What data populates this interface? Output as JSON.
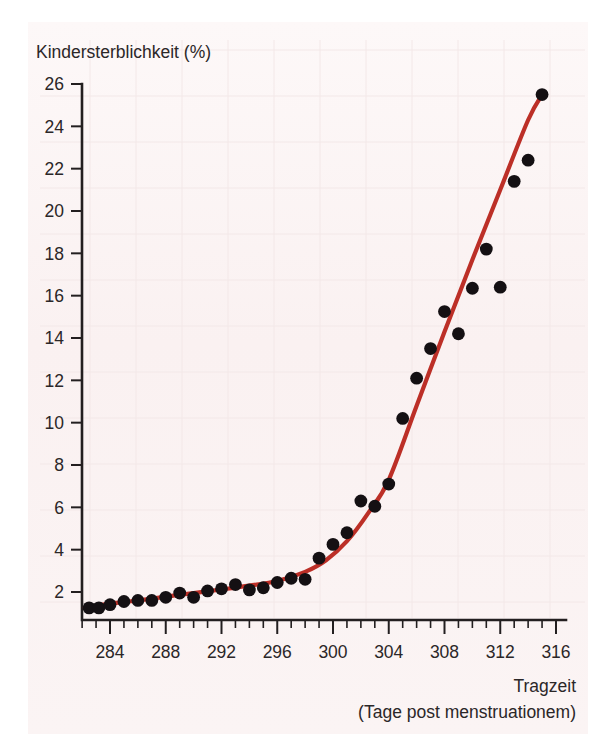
{
  "figure": {
    "background_color": "#fbf4f4",
    "page_color": "#ffffff",
    "line_color": "#bc2f27",
    "point_color": "#141013",
    "axis_color": "#231f20"
  },
  "chart_data": {
    "type": "scatter",
    "title": "",
    "subtitle": "",
    "ylabel": "Kindersterblichkeit (%)",
    "xlabel": "Tragzeit",
    "xlabel_sub": "(Tage post menstruationem)",
    "xlim": [
      282,
      317
    ],
    "ylim": [
      0.8,
      26
    ],
    "xticks": [
      284,
      288,
      292,
      296,
      300,
      304,
      308,
      312,
      316
    ],
    "xticklabels": [
      "284",
      "288",
      "292",
      "296",
      "300",
      "304",
      "308",
      "312",
      "316"
    ],
    "xtick_minor_step": 1,
    "yticks": [
      2,
      4,
      6,
      8,
      10,
      12,
      14,
      16,
      18,
      20,
      22,
      24,
      26
    ],
    "yticklabels": [
      "2",
      "4",
      "6",
      "8",
      "10",
      "12",
      "14",
      "16",
      "18",
      "20",
      "22",
      "24",
      "26"
    ],
    "grid": false,
    "legend": "none",
    "series": [
      {
        "name": "Kindersterblichkeit Messpunkte",
        "type": "scatter",
        "marker": "filled-circle",
        "x": [
          282.5,
          283.2,
          284.0,
          285.0,
          286.0,
          287.0,
          288.0,
          289.0,
          290.0,
          291.0,
          292.0,
          293.0,
          294.0,
          295.0,
          296.0,
          297.0,
          298.0,
          299.0,
          300.0,
          301.0,
          302.0,
          303.0,
          304.0,
          305.0,
          306.0,
          307.0,
          308.0,
          309.0,
          310.0,
          311.0,
          312.0,
          313.0,
          314.0,
          315.0
        ],
        "y": [
          1.25,
          1.25,
          1.4,
          1.55,
          1.6,
          1.6,
          1.75,
          1.95,
          1.75,
          2.05,
          2.15,
          2.35,
          2.1,
          2.2,
          2.45,
          2.65,
          2.6,
          3.6,
          4.25,
          4.8,
          6.3,
          6.05,
          7.1,
          10.2,
          12.1,
          13.5,
          15.25,
          14.2,
          16.35,
          18.2,
          16.4,
          21.4,
          22.4,
          25.5
        ]
      },
      {
        "name": "Regressionskurve",
        "type": "line",
        "x": [
          282.2,
          284,
          286,
          288,
          290,
          292,
          294,
          296,
          298,
          299.5,
          301,
          302.5,
          304,
          306,
          308,
          310,
          312,
          314,
          315.1
        ],
        "y": [
          1.25,
          1.45,
          1.6,
          1.78,
          1.95,
          2.12,
          2.3,
          2.52,
          2.95,
          3.5,
          4.4,
          5.7,
          7.3,
          10.8,
          14.3,
          17.7,
          21.0,
          24.3,
          25.6
        ]
      }
    ]
  }
}
